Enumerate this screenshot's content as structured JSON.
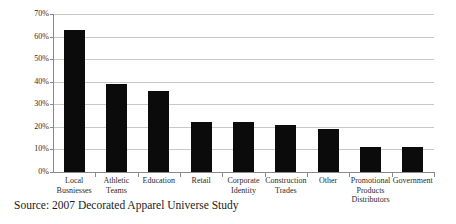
{
  "caption": "Source: 2007 Decorated Apparel Universe Study",
  "chart_data": {
    "type": "bar",
    "title": "",
    "xlabel": "",
    "ylabel": "",
    "ylim": [
      0,
      70
    ],
    "ytick_step": 10,
    "grid": true,
    "legend": "none",
    "bar_color": "#0b0b0b",
    "gridline_color": "#c8c8c8",
    "axis_color": "#8a8a8a",
    "ytick_labels": [
      "0%",
      "10%",
      "20%",
      "30%",
      "40%",
      "50%",
      "60%",
      "70%"
    ],
    "ytick_values": [
      0,
      10,
      20,
      30,
      40,
      50,
      60,
      70
    ],
    "categories": [
      "Local Busniesses",
      "Athletic Teams",
      "Education",
      "Retail",
      "Corporate Identity",
      "Construction Trades",
      "Other",
      "Promotional Products Distributors",
      "Government"
    ],
    "category_lines": [
      [
        "Local",
        "Busniesses"
      ],
      [
        "Athletic",
        "Teams"
      ],
      [
        "Education"
      ],
      [
        "Retail"
      ],
      [
        "Corporate",
        "Identity"
      ],
      [
        "Construction",
        "Trades"
      ],
      [
        "Other"
      ],
      [
        "Promotional",
        "Products",
        "Distributors"
      ],
      [
        "Government"
      ]
    ],
    "values": [
      63,
      39,
      36,
      22,
      22,
      21,
      19,
      11,
      11
    ]
  }
}
